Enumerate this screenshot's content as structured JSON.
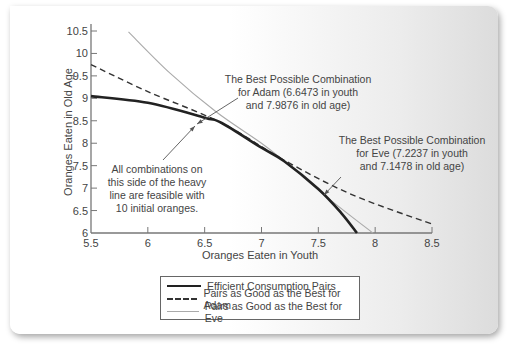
{
  "chart_data": {
    "type": "line",
    "title": "",
    "xlabel": "Oranges Eaten in Youth",
    "ylabel": "Oranges Eaten in Old Age",
    "xlim": [
      5.5,
      8.5
    ],
    "ylim": [
      6,
      10.5
    ],
    "x_ticks": [
      "5.5",
      "6",
      "6.5",
      "7",
      "7.5",
      "8",
      "8.5"
    ],
    "y_ticks": [
      "6",
      "6.5",
      "7",
      "7.5",
      "8",
      "8.5",
      "9",
      "9.5",
      "10",
      "10.5"
    ],
    "grid": false,
    "legend_position": "bottom-center",
    "series": [
      {
        "name": "Efficient Consumption Pairs",
        "style": "solid-thick",
        "color": "#222222",
        "points": [
          [
            5.5,
            9.05
          ],
          [
            6.0,
            8.9
          ],
          [
            6.5,
            8.57
          ],
          [
            6.65,
            8.45
          ],
          [
            7.0,
            7.9
          ],
          [
            7.2,
            7.6
          ],
          [
            7.5,
            6.98
          ],
          [
            7.7,
            6.45
          ],
          [
            7.84,
            6.0
          ]
        ]
      },
      {
        "name": "Pairs as Good as the Best for Adam",
        "style": "dashed",
        "color": "#333333",
        "points": [
          [
            5.5,
            9.75
          ],
          [
            6.0,
            9.15
          ],
          [
            6.65,
            8.45
          ],
          [
            7.2,
            7.62
          ],
          [
            7.8,
            6.85
          ],
          [
            8.5,
            6.2
          ]
        ]
      },
      {
        "name": "Pairs as Good as the Best for Eve",
        "style": "solid-thin",
        "color": "#aaaaaa",
        "points": [
          [
            5.83,
            10.48
          ],
          [
            6.2,
            9.55
          ],
          [
            6.6,
            8.7
          ],
          [
            7.0,
            8.0
          ],
          [
            7.2,
            7.6
          ],
          [
            7.6,
            6.75
          ],
          [
            7.98,
            6.0
          ]
        ]
      }
    ],
    "annotations": [
      {
        "id": "adam",
        "lines": [
          "The Best Possible Combination",
          "for Adam (6.6473 in youth",
          "and 7.9876 in old age)"
        ]
      },
      {
        "id": "eve",
        "lines": [
          "The Best Possible Combination",
          "for Eve (7.2237 in youth",
          "and 7.1478 in old age)"
        ]
      },
      {
        "id": "feasible",
        "lines": [
          "All combinations on",
          "this side of the heavy",
          "line are feasible with",
          "10 initial oranges."
        ]
      }
    ]
  },
  "legend": {
    "items": [
      {
        "label": "Efficient Consumption Pairs"
      },
      {
        "label": "Pairs as Good as the Best for Adam"
      },
      {
        "label": "Pairs as Good as the Best for Eve"
      }
    ]
  }
}
